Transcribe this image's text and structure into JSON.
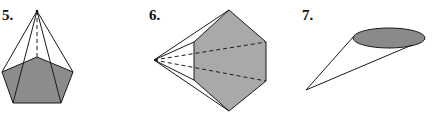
{
  "figures": [
    {
      "label": "5.",
      "shape": "pentagonal-pyramid",
      "base_fill": "#8c8c8c"
    },
    {
      "label": "6.",
      "shape": "hexagonal-pyramid",
      "base_fill": "#a9a9a9"
    },
    {
      "label": "7.",
      "shape": "oblique-cone",
      "base_fill": "#8a8a8a"
    }
  ]
}
